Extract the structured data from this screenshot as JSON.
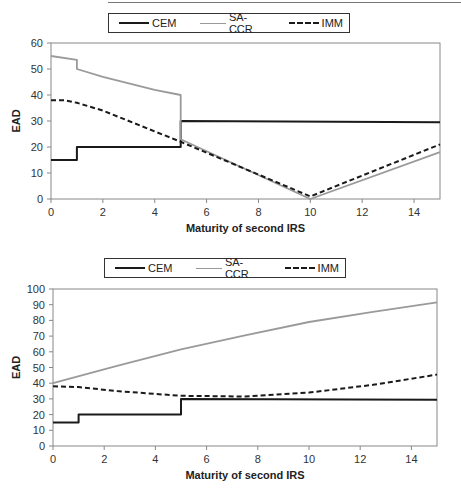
{
  "legend": {
    "items": [
      {
        "label": "CEM",
        "style": "solid-black"
      },
      {
        "label": "SA-CCR",
        "style": "solid-gray"
      },
      {
        "label": "IMM",
        "style": "dashed-black"
      }
    ]
  },
  "colors": {
    "CEM": "#1a1a1a",
    "SA-CCR": "#999999",
    "IMM": "#1a1a1a"
  },
  "chart_data": [
    {
      "type": "line",
      "title": "",
      "xlabel": "Maturity of second IRS",
      "ylabel": "EAD",
      "xlim": [
        0,
        15
      ],
      "ylim": [
        0,
        60
      ],
      "xticks": [
        0,
        2,
        4,
        6,
        8,
        10,
        12,
        14
      ],
      "yticks": [
        0,
        10,
        20,
        30,
        40,
        50,
        60
      ],
      "grid": false,
      "legend_position": "top",
      "series": [
        {
          "name": "CEM",
          "x": [
            0,
            1,
            1,
            5,
            5,
            15
          ],
          "y": [
            15,
            15,
            20,
            20,
            30,
            29.5
          ]
        },
        {
          "name": "SA-CCR",
          "x": [
            0,
            1,
            1,
            2,
            3,
            4,
            5,
            5,
            10,
            15
          ],
          "y": [
            55,
            53.5,
            50,
            47,
            44.5,
            42,
            40,
            23,
            0,
            18
          ]
        },
        {
          "name": "IMM",
          "x": [
            0,
            0.5,
            1,
            2,
            3,
            4,
            5,
            10,
            15
          ],
          "y": [
            38,
            38,
            37,
            34,
            30,
            26,
            22,
            1,
            21
          ]
        }
      ]
    },
    {
      "type": "line",
      "title": "",
      "xlabel": "Maturity of second IRS",
      "ylabel": "EAD",
      "xlim": [
        0,
        15
      ],
      "ylim": [
        0,
        100
      ],
      "xticks": [
        0,
        2,
        4,
        6,
        8,
        10,
        12,
        14
      ],
      "yticks": [
        0,
        10,
        20,
        30,
        40,
        50,
        60,
        70,
        80,
        90,
        100
      ],
      "grid": false,
      "legend_position": "top",
      "series": [
        {
          "name": "CEM",
          "x": [
            0,
            1,
            1,
            5,
            5,
            15
          ],
          "y": [
            15,
            15,
            20,
            20,
            30,
            29.5
          ]
        },
        {
          "name": "SA-CCR",
          "x": [
            0,
            2.5,
            5,
            7.5,
            10,
            12.5,
            15
          ],
          "y": [
            40,
            51,
            61.5,
            70.5,
            79,
            85.5,
            91.5
          ]
        },
        {
          "name": "IMM",
          "x": [
            0,
            1,
            2.5,
            5,
            7.5,
            10,
            12.5,
            15
          ],
          "y": [
            38,
            37.5,
            35,
            32,
            31.5,
            34,
            39,
            45.5
          ]
        }
      ]
    }
  ]
}
